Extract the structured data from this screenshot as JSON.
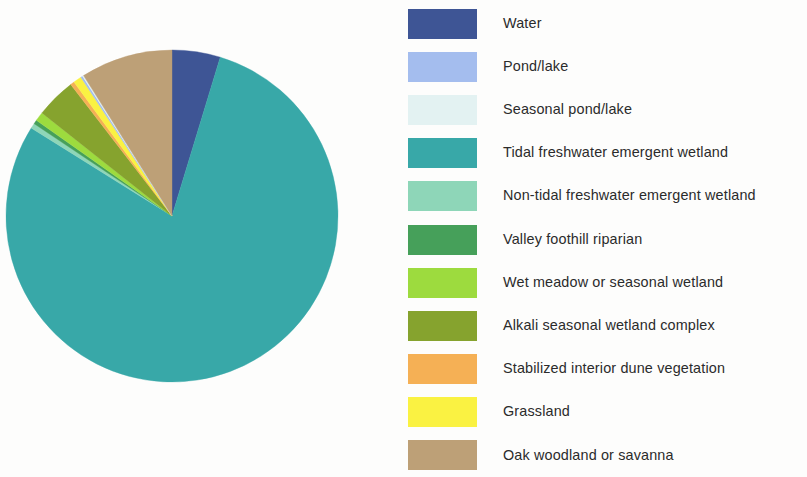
{
  "chart_data": {
    "type": "pie",
    "title": "",
    "subtitle": "",
    "xlabel": "",
    "ylabel": "",
    "legend_position": "right",
    "grid": false,
    "start_angle_deg": 0,
    "direction": "clockwise",
    "categories": [
      "Water",
      "Pond/lake",
      "Seasonal pond/lake",
      "Tidal freshwater emergent wetland",
      "Non-tidal freshwater emergent wetland",
      "Valley foothill riparian",
      "Wet meadow or seasonal wetland",
      "Alkali seasonal wetland complex",
      "Stabilized interior dune vegetation",
      "Grassland",
      "Oak woodland or savanna"
    ],
    "values": [
      4.7,
      0.2,
      0.1,
      79.2,
      0.5,
      0.4,
      0.9,
      3.9,
      0.4,
      0.8,
      8.9
    ],
    "colors": [
      "#3e5595",
      "#a4bdee",
      "#e3f2f2",
      "#38a8a8",
      "#8ed6b8",
      "#46a05a",
      "#9ddb3e",
      "#86a32e",
      "#f5b055",
      "#faf242",
      "#bda077"
    ],
    "slices": [
      {
        "label": "Water",
        "value": 4.7,
        "color": "#3e5595",
        "angle_deg": 16.9
      },
      {
        "label": "Tidal freshwater emergent wetland",
        "value": 79.2,
        "color": "#38a8a8",
        "angle_deg": 285.1
      },
      {
        "label": "Non-tidal freshwater emergent wetland",
        "value": 0.5,
        "color": "#8ed6b8",
        "angle_deg": 1.8
      },
      {
        "label": "Valley foothill riparian",
        "value": 0.4,
        "color": "#46a05a",
        "angle_deg": 1.4
      },
      {
        "label": "Wet meadow or seasonal wetland",
        "value": 0.9,
        "color": "#9ddb3e",
        "angle_deg": 3.2
      },
      {
        "label": "Alkali seasonal wetland complex",
        "value": 3.9,
        "color": "#86a32e",
        "angle_deg": 14.0
      },
      {
        "label": "Stabilized interior dune vegetation",
        "value": 0.4,
        "color": "#f5b055",
        "angle_deg": 1.4
      },
      {
        "label": "Grassland",
        "value": 0.8,
        "color": "#faf242",
        "angle_deg": 2.9
      },
      {
        "label": "Pond/lake",
        "value": 0.2,
        "color": "#a4bdee",
        "angle_deg": 0.7
      },
      {
        "label": "Seasonal pond/lake",
        "value": 0.1,
        "color": "#e3f2f2",
        "angle_deg": 0.4
      },
      {
        "label": "Oak woodland or savanna",
        "value": 8.9,
        "color": "#bda077",
        "angle_deg": 32.2
      }
    ]
  },
  "legend": {
    "items": [
      {
        "label": "Water",
        "color": "#3e5595"
      },
      {
        "label": "Pond/lake",
        "color": "#a4bdee"
      },
      {
        "label": "Seasonal pond/lake",
        "color": "#e3f2f2"
      },
      {
        "label": "Tidal freshwater emergent wetland",
        "color": "#38a8a8"
      },
      {
        "label": "Non-tidal freshwater emergent wetland",
        "color": "#8ed6b8"
      },
      {
        "label": "Valley foothill riparian",
        "color": "#46a05a"
      },
      {
        "label": "Wet meadow or seasonal wetland",
        "color": "#9ddb3e"
      },
      {
        "label": "Alkali seasonal wetland complex",
        "color": "#86a32e"
      },
      {
        "label": "Stabilized interior dune vegetation",
        "color": "#f5b055"
      },
      {
        "label": "Grassland",
        "color": "#faf242"
      },
      {
        "label": "Oak woodland or savanna",
        "color": "#bda077"
      }
    ]
  },
  "pie_geometry": {
    "cx": 172,
    "cy": 216,
    "r": 166
  }
}
